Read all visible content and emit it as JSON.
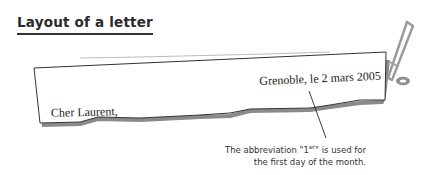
{
  "section": {
    "title": "Layout of a letter"
  },
  "letter": {
    "date_line": "Grenoble, le 2 mars 2005",
    "greeting": "Cher Laurent,"
  },
  "annotation": {
    "line1_prefix": "The abbreviation \"1",
    "line1_sup": "er",
    "line1_suffix": "\" is used for",
    "line2": "the first day of the month."
  },
  "decorations": {
    "pen_icon": "pen-icon",
    "clip_icon": "paper-clip-icon"
  },
  "colors": {
    "text": "#222222",
    "paper_outline": "#333333",
    "shadow": "#888888",
    "pen": "#999999"
  }
}
